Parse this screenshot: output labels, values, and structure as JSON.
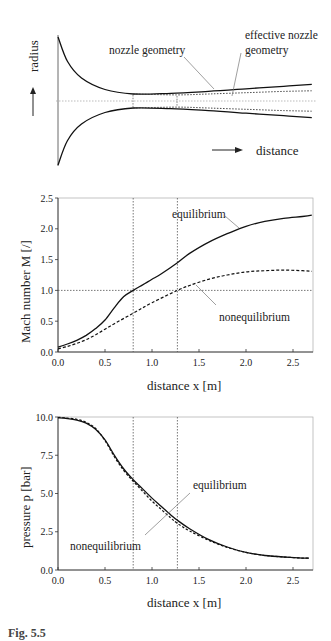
{
  "chart_data": [
    {
      "type": "line",
      "title": "",
      "panel": "nozzle-geometry-schematic",
      "xlabel": "distance",
      "ylabel": "radius",
      "grid": false,
      "annotations": [
        "nozzle geometry",
        "effective nozzle geometry"
      ],
      "series": [
        {
          "name": "nozzle geometry",
          "style": "solid",
          "x": [
            0.0,
            0.1,
            0.25,
            0.5,
            0.8,
            1.2,
            1.6,
            2.0,
            2.4,
            2.7
          ],
          "y": [
            1.0,
            0.62,
            0.36,
            0.18,
            0.11,
            0.12,
            0.15,
            0.19,
            0.23,
            0.26
          ]
        },
        {
          "name": "effective nozzle geometry",
          "style": "dotted",
          "x": [
            0.8,
            1.27,
            1.6,
            2.0,
            2.4,
            2.7
          ],
          "y": [
            0.11,
            0.095,
            0.11,
            0.13,
            0.15,
            0.16
          ]
        }
      ],
      "markers": [
        {
          "x": 0.8,
          "label": "geometric throat"
        },
        {
          "x": 1.27,
          "label": "effective throat"
        }
      ]
    },
    {
      "type": "line",
      "title": "",
      "xlabel": "distance x [m]",
      "ylabel": "Mach number M [/]",
      "xlim": [
        0.0,
        2.7
      ],
      "ylim": [
        0.0,
        2.5
      ],
      "xticks": [
        0.0,
        0.5,
        1.0,
        1.5,
        2.0,
        2.5
      ],
      "yticks": [
        0.0,
        0.5,
        1.0,
        1.5,
        2.0,
        2.5
      ],
      "xtick_labels": [
        "0.0",
        "0.5",
        "1.0",
        "1.5",
        "2.0",
        "2.5"
      ],
      "ytick_labels": [
        "0.0",
        "0.5",
        "1.0",
        "1.5",
        "2.0",
        "2.5"
      ],
      "grid": false,
      "reference_lines": [
        {
          "orientation": "horizontal",
          "value": 1.0,
          "style": "dotted"
        },
        {
          "orientation": "vertical",
          "value": 0.8,
          "style": "dotted"
        },
        {
          "orientation": "vertical",
          "value": 1.27,
          "style": "dotted"
        }
      ],
      "series": [
        {
          "name": "equilibrium",
          "style": "solid",
          "x": [
            0.0,
            0.1,
            0.2,
            0.3,
            0.4,
            0.5,
            0.6,
            0.7,
            0.8,
            0.9,
            1.0,
            1.1,
            1.27,
            1.4,
            1.6,
            1.8,
            2.0,
            2.2,
            2.4,
            2.6,
            2.7
          ],
          "y": [
            0.08,
            0.13,
            0.19,
            0.27,
            0.38,
            0.52,
            0.72,
            0.9,
            1.0,
            1.09,
            1.18,
            1.27,
            1.45,
            1.6,
            1.78,
            1.92,
            2.04,
            2.12,
            2.17,
            2.2,
            2.22
          ]
        },
        {
          "name": "nonequilibrium",
          "style": "dashed",
          "x": [
            0.0,
            0.1,
            0.2,
            0.3,
            0.4,
            0.5,
            0.6,
            0.8,
            1.0,
            1.27,
            1.4,
            1.6,
            1.8,
            2.0,
            2.2,
            2.4,
            2.6,
            2.7
          ],
          "y": [
            0.05,
            0.09,
            0.14,
            0.2,
            0.28,
            0.37,
            0.46,
            0.63,
            0.8,
            1.0,
            1.08,
            1.18,
            1.25,
            1.3,
            1.32,
            1.33,
            1.32,
            1.31
          ]
        }
      ],
      "annotations": [
        "equilibrium",
        "nonequilibrium"
      ]
    },
    {
      "type": "line",
      "title": "",
      "xlabel": "distance x [m]",
      "ylabel": "pressure p [bar]",
      "xlim": [
        0.0,
        2.7
      ],
      "ylim": [
        0.0,
        10.0
      ],
      "xticks": [
        0.0,
        0.5,
        1.0,
        1.5,
        2.0,
        2.5
      ],
      "yticks": [
        0.0,
        2.5,
        5.0,
        7.5,
        10.0
      ],
      "xtick_labels": [
        "0.0",
        "0.5",
        "1.0",
        "1.5",
        "2.0",
        "2.5"
      ],
      "ytick_labels": [
        "0.0",
        "2.5",
        "5.0",
        "7.5",
        "10.0"
      ],
      "grid": false,
      "reference_lines": [
        {
          "orientation": "vertical",
          "value": 0.8,
          "style": "dotted"
        },
        {
          "orientation": "vertical",
          "value": 1.27,
          "style": "dotted"
        }
      ],
      "series": [
        {
          "name": "equilibrium",
          "style": "solid",
          "x": [
            0.0,
            0.1,
            0.2,
            0.3,
            0.4,
            0.5,
            0.6,
            0.7,
            0.8,
            0.9,
            1.0,
            1.1,
            1.2,
            1.27,
            1.4,
            1.6,
            1.8,
            2.0,
            2.2,
            2.4,
            2.6,
            2.67
          ],
          "y": [
            9.95,
            9.9,
            9.8,
            9.6,
            9.2,
            8.5,
            7.5,
            6.6,
            5.9,
            5.3,
            4.7,
            4.15,
            3.6,
            3.25,
            2.7,
            2.0,
            1.5,
            1.15,
            0.95,
            0.85,
            0.78,
            0.77
          ]
        },
        {
          "name": "nonequilibrium",
          "style": "dashed",
          "x": [
            0.0,
            0.1,
            0.2,
            0.3,
            0.4,
            0.5,
            0.6,
            0.7,
            0.8,
            0.9,
            1.0,
            1.1,
            1.2,
            1.27,
            1.4,
            1.6,
            1.8,
            2.0,
            2.2,
            2.4,
            2.6,
            2.67
          ],
          "y": [
            9.98,
            9.93,
            9.85,
            9.65,
            9.25,
            8.45,
            7.4,
            6.5,
            5.8,
            5.15,
            4.5,
            3.95,
            3.4,
            3.05,
            2.55,
            1.95,
            1.48,
            1.15,
            0.95,
            0.85,
            0.78,
            0.77
          ]
        }
      ],
      "annotations": [
        "equilibrium",
        "nonequilibrium"
      ]
    }
  ],
  "panel1": {
    "ylabel": "radius",
    "xlabel": "distance",
    "label_nozzle": "nozzle geometry",
    "label_effective_1": "effective nozzle",
    "label_effective_2": "geometry"
  },
  "panel2": {
    "ylabel": "Mach number M [/]",
    "xlabel": "distance x [m]",
    "label_eq": "equilibrium",
    "label_neq": "nonequilibrium",
    "yticks": [
      "0.0",
      "0.5",
      "1.0",
      "1.5",
      "2.0",
      "2.5"
    ],
    "xticks": [
      "0.0",
      "0.5",
      "1.0",
      "1.5",
      "2.0",
      "2.5"
    ]
  },
  "panel3": {
    "ylabel": "pressure p [bar]",
    "xlabel": "distance x [m]",
    "label_eq": "equilibrium",
    "label_neq": "nonequilibrium",
    "yticks": [
      "0.0",
      "2.5",
      "5.0",
      "7.5",
      "10.0"
    ],
    "xticks": [
      "0.0",
      "0.5",
      "1.0",
      "1.5",
      "2.0",
      "2.5"
    ]
  },
  "caption": "Fig. 5.5"
}
